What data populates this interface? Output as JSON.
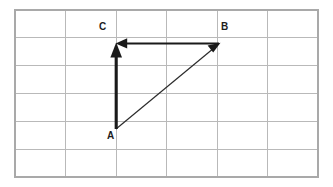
{
  "figure": {
    "type": "vector-diagram",
    "background_color": "#ffffff"
  },
  "grid": {
    "columns": 6,
    "rows": 6,
    "left": 15,
    "top": 10,
    "right": 318,
    "bottom": 177,
    "cell_width": 50.5,
    "cell_height": 27.83,
    "line_color": "#b9b9b9",
    "border_color": "#a9a9a9",
    "x_lines": [
      15,
      65.5,
      116,
      166.5,
      217,
      267.5,
      318
    ],
    "y_lines": [
      10,
      37.8,
      65.7,
      93.5,
      121.3,
      149.2,
      177
    ]
  },
  "points": [
    {
      "id": "A",
      "label": "A",
      "x": 116,
      "y": 129
    },
    {
      "id": "B",
      "label": "B",
      "x": 219,
      "y": 44
    },
    {
      "id": "C",
      "label": "C",
      "x": 116,
      "y": 44
    }
  ],
  "vectors": [
    {
      "id": "AC",
      "from": "A",
      "to": "C",
      "orientation": "vertical",
      "weight": "thick",
      "color": "#1a1a1a",
      "arrowhead": "solid-triangle"
    },
    {
      "id": "BC",
      "from": "B",
      "to": "C",
      "orientation": "horizontal",
      "weight": "medium",
      "color": "#1a1a1a",
      "arrowhead": "solid-triangle"
    },
    {
      "id": "AB",
      "from": "A",
      "to": "B",
      "orientation": "diagonal",
      "weight": "thin",
      "color": "#2b2b2b",
      "arrowhead": "solid-triangle"
    }
  ],
  "labels": {
    "a": "A",
    "b": "B",
    "c": "C"
  }
}
